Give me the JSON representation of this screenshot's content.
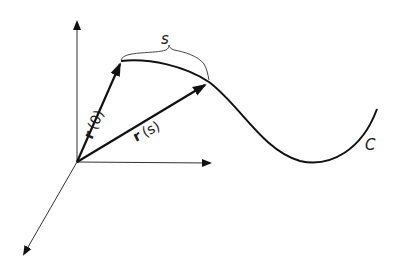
{
  "diagram": {
    "title": "",
    "labels": {
      "arc_length": "s",
      "curve": "C",
      "r0_bold": "r",
      "r0_arg": "(0)",
      "rs_bold": "r",
      "rs_arg": "(s)"
    },
    "elements": [
      {
        "type": "axis",
        "name": "z-axis",
        "from": [
          77,
          162
        ],
        "to": [
          77,
          20
        ]
      },
      {
        "type": "axis",
        "name": "y-axis",
        "from": [
          77,
          162
        ],
        "to": [
          212,
          163
        ]
      },
      {
        "type": "axis",
        "name": "x-axis",
        "from": [
          77,
          162
        ],
        "to": [
          23,
          256
        ]
      },
      {
        "type": "vector",
        "name": "r(0)",
        "from": [
          77,
          162
        ],
        "to": [
          121,
          62
        ]
      },
      {
        "type": "vector",
        "name": "r(s)",
        "from": [
          77,
          162
        ],
        "to": [
          207,
          84
        ]
      },
      {
        "type": "curve",
        "name": "C",
        "start": [
          121,
          61
        ],
        "end": [
          377,
          109
        ]
      },
      {
        "type": "brace",
        "name": "s",
        "from": [
          121,
          61
        ],
        "to": [
          209,
          80
        ]
      }
    ],
    "colors": {
      "stroke": "#111111",
      "background": "#ffffff"
    }
  }
}
